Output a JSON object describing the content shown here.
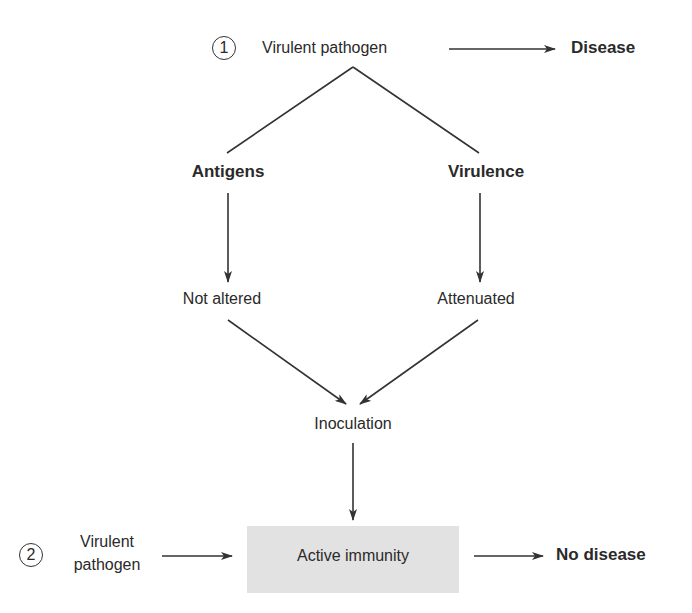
{
  "diagram": {
    "path1": {
      "number": "1",
      "source": "Virulent pathogen",
      "outcome": "Disease"
    },
    "branches": {
      "left": {
        "label": "Antigens",
        "result": "Not altered"
      },
      "right": {
        "label": "Virulence",
        "result": "Attenuated"
      }
    },
    "process": "Inoculation",
    "path2": {
      "number": "2",
      "source_line1": "Virulent",
      "source_line2": "pathogen",
      "state": "Active immunity",
      "outcome": "No disease"
    },
    "colors": {
      "line": "#333333",
      "box_fill": "#e2e2e2",
      "text": "#2a2a2a"
    }
  }
}
